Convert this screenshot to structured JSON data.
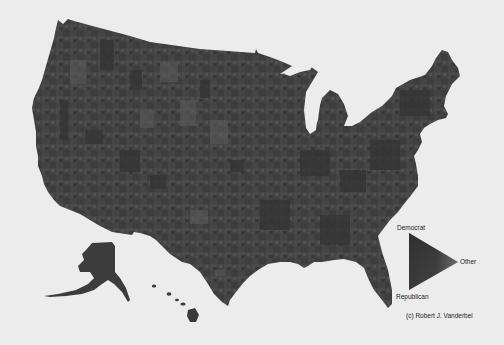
{
  "map": {
    "title": "",
    "subject": "US presidential election results by county (grayscale)",
    "colors": {
      "background": "#ececec",
      "land_base": "#434343",
      "land_dark": "#353535",
      "land_light": "#575757",
      "water": "#ececec"
    },
    "regions": [
      "Contiguous United States",
      "Alaska",
      "Hawaii"
    ]
  },
  "legend": {
    "type": "ternary-triangle",
    "vertices": [
      {
        "label": "Democrat",
        "position": "top",
        "color": "#303030"
      },
      {
        "label": "Republican",
        "position": "bottom",
        "color": "#3c3c3c"
      },
      {
        "label": "Other",
        "position": "right",
        "color": "#8a8a8a"
      }
    ]
  },
  "credit": {
    "text": "(c) Robert J. Vanderbei"
  }
}
